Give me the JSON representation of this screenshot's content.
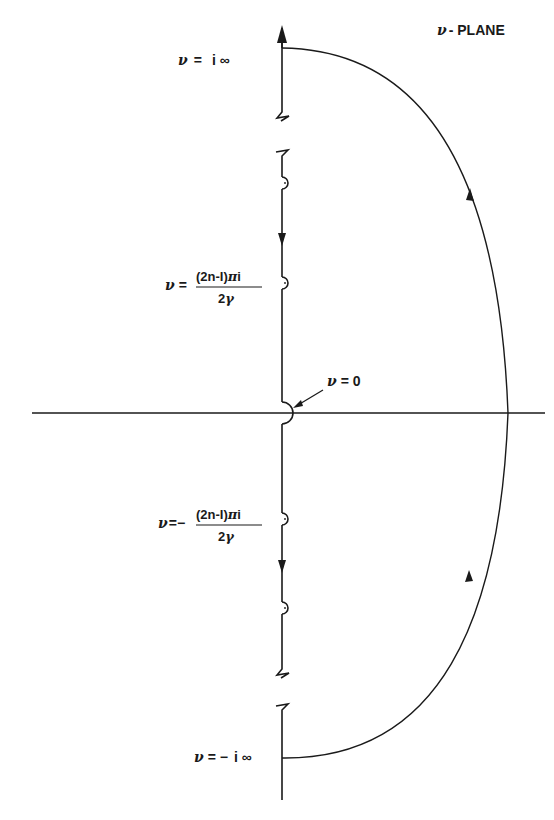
{
  "diagram": {
    "labels": {
      "top": {
        "nu": "ν",
        "eq": "=",
        "val": "i ∞"
      },
      "bottom": {
        "nu": "ν",
        "eq": "= −",
        "val": "i ∞"
      },
      "origin": {
        "nu": "ν",
        "eq": "= 0"
      },
      "pole_pos": {
        "nu": "ν",
        "eq": "=",
        "num": "(2n-1)πi",
        "den": "2γ"
      },
      "pole_neg": {
        "nu": "ν",
        "eq": "=−",
        "num": "(2n-1)πi",
        "den": "2γ"
      }
    },
    "contour": "Closed contour along imaginary axis with semicircular indentations around poles and origin, closed by large semicircle in right half-plane",
    "colors": {
      "stroke": "#1a1a1a",
      "background": "#ffffff"
    }
  }
}
